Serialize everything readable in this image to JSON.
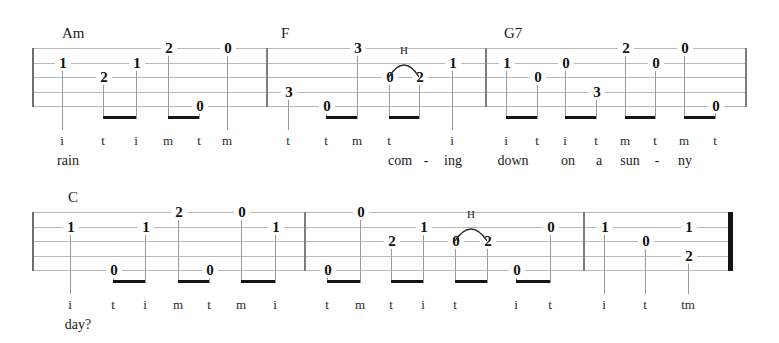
{
  "document": {
    "type": "banjo-tablature",
    "title": "",
    "num_systems": 2,
    "num_strings": 5,
    "notation": {
      "hammer_on_label": "H",
      "thumb": "t",
      "index": "i",
      "middle": "m"
    }
  },
  "colors": {
    "staff_line": "#b9b9bb",
    "barline": "#7d7d80",
    "final_barline": "#151515",
    "beam": "#141414",
    "text": "#1a1a1a",
    "background": "#ffffff"
  },
  "systems": [
    {
      "id": "system-1",
      "staff_top": 48,
      "staff_bottom": 106,
      "staff_left": 32,
      "staff_right": 747,
      "barlines": [
        266,
        485
      ],
      "measures": [
        {
          "id": "measure-1",
          "chord": "Am",
          "chord_x": 62,
          "chord_y": 26,
          "notes": [
            {
              "x": 62,
              "string": 2,
              "fret": "1"
            },
            {
              "x": 103,
              "string": 3,
              "fret": "2"
            },
            {
              "x": 136,
              "string": 2,
              "fret": "1"
            },
            {
              "x": 168,
              "string": 1,
              "fret": "2"
            },
            {
              "x": 199,
              "string": 5,
              "fret": "0"
            },
            {
              "x": 227,
              "string": 1,
              "fret": "0"
            }
          ],
          "beams": [
            {
              "x1": 103,
              "x2": 136
            },
            {
              "x1": 168,
              "x2": 199
            }
          ],
          "fingers": [
            {
              "x": 62,
              "label": "i"
            },
            {
              "x": 103,
              "label": "t"
            },
            {
              "x": 136,
              "label": "i"
            },
            {
              "x": 168,
              "label": "m"
            },
            {
              "x": 199,
              "label": "t"
            },
            {
              "x": 227,
              "label": "m"
            }
          ],
          "lyrics": [
            {
              "x": 68,
              "text": "rain"
            }
          ]
        },
        {
          "id": "measure-2",
          "chord": "F",
          "chord_x": 281,
          "chord_y": 26,
          "notes": [
            {
              "x": 288,
              "string": 4,
              "fret": "3"
            },
            {
              "x": 326,
              "string": 5,
              "fret": "0"
            },
            {
              "x": 357,
              "string": 1,
              "fret": "3"
            },
            {
              "x": 389,
              "string": 3,
              "fret": "0"
            },
            {
              "x": 419,
              "string": 3,
              "fret": "2"
            },
            {
              "x": 452,
              "string": 2,
              "fret": "1"
            }
          ],
          "beams": [
            {
              "x1": 326,
              "x2": 357
            },
            {
              "x1": 389,
              "x2": 419
            }
          ],
          "hammers": [
            {
              "x1": 389,
              "x2": 419,
              "label": "H"
            }
          ],
          "fingers": [
            {
              "x": 288,
              "label": "t"
            },
            {
              "x": 326,
              "label": "t"
            },
            {
              "x": 357,
              "label": "m"
            },
            {
              "x": 389,
              "label": "t"
            },
            {
              "x": 452,
              "label": "i"
            }
          ],
          "lyrics": [
            {
              "x": 400,
              "text": "com"
            },
            {
              "x": 426,
              "text": "-"
            },
            {
              "x": 453,
              "text": "ing"
            }
          ]
        },
        {
          "id": "measure-3",
          "chord": "G7",
          "chord_x": 504,
          "chord_y": 26,
          "notes": [
            {
              "x": 506,
              "string": 2,
              "fret": "1"
            },
            {
              "x": 537,
              "string": 3,
              "fret": "0"
            },
            {
              "x": 565,
              "string": 2,
              "fret": "0"
            },
            {
              "x": 596,
              "string": 4,
              "fret": "3"
            },
            {
              "x": 625,
              "string": 1,
              "fret": "2"
            },
            {
              "x": 655,
              "string": 2,
              "fret": "0"
            },
            {
              "x": 684,
              "string": 1,
              "fret": "0"
            },
            {
              "x": 715,
              "string": 5,
              "fret": "0"
            }
          ],
          "beams": [
            {
              "x1": 506,
              "x2": 537
            },
            {
              "x1": 565,
              "x2": 596
            },
            {
              "x1": 625,
              "x2": 655
            },
            {
              "x1": 684,
              "x2": 715
            }
          ],
          "fingers": [
            {
              "x": 506,
              "label": "i"
            },
            {
              "x": 537,
              "label": "t"
            },
            {
              "x": 565,
              "label": "i"
            },
            {
              "x": 596,
              "label": "t"
            },
            {
              "x": 625,
              "label": "m"
            },
            {
              "x": 655,
              "label": "t"
            },
            {
              "x": 684,
              "label": "m"
            },
            {
              "x": 715,
              "label": "t"
            }
          ],
          "lyrics": [
            {
              "x": 513,
              "text": "down"
            },
            {
              "x": 568,
              "text": "on"
            },
            {
              "x": 599,
              "text": "a"
            },
            {
              "x": 630,
              "text": "sun"
            },
            {
              "x": 657,
              "text": "-"
            },
            {
              "x": 685,
              "text": "ny"
            }
          ]
        }
      ]
    },
    {
      "id": "system-2",
      "staff_top": 212,
      "staff_bottom": 270,
      "staff_left": 32,
      "staff_right": 733,
      "barlines": [
        304,
        583
      ],
      "measures": [
        {
          "id": "measure-4",
          "chord": "C",
          "chord_x": 68,
          "chord_y": 190,
          "notes": [
            {
              "x": 70,
              "string": 2,
              "fret": "1"
            },
            {
              "x": 113,
              "string": 5,
              "fret": "0"
            },
            {
              "x": 145,
              "string": 2,
              "fret": "1"
            },
            {
              "x": 178,
              "string": 1,
              "fret": "2"
            },
            {
              "x": 209,
              "string": 5,
              "fret": "0"
            },
            {
              "x": 241,
              "string": 1,
              "fret": "0"
            },
            {
              "x": 275,
              "string": 2,
              "fret": "1"
            }
          ],
          "beams": [
            {
              "x1": 113,
              "x2": 145
            },
            {
              "x1": 178,
              "x2": 209
            },
            {
              "x1": 241,
              "x2": 275
            }
          ],
          "fingers": [
            {
              "x": 70,
              "label": "i"
            },
            {
              "x": 113,
              "label": "t"
            },
            {
              "x": 145,
              "label": "i"
            },
            {
              "x": 178,
              "label": "m"
            },
            {
              "x": 209,
              "label": "t"
            },
            {
              "x": 241,
              "label": "m"
            },
            {
              "x": 275,
              "label": "i"
            }
          ],
          "lyrics": [
            {
              "x": 78,
              "text": "day?"
            }
          ]
        },
        {
          "id": "measure-5",
          "chord": "",
          "chord_x": 0,
          "chord_y": 0,
          "notes": [
            {
              "x": 327,
              "string": 5,
              "fret": "0"
            },
            {
              "x": 360,
              "string": 1,
              "fret": "0"
            },
            {
              "x": 391,
              "string": 3,
              "fret": "2"
            },
            {
              "x": 423,
              "string": 2,
              "fret": "1"
            },
            {
              "x": 455,
              "string": 3,
              "fret": "0"
            },
            {
              "x": 487,
              "string": 3,
              "fret": "2"
            },
            {
              "x": 516,
              "string": 5,
              "fret": "0"
            },
            {
              "x": 550,
              "string": 2,
              "fret": "0"
            }
          ],
          "beams": [
            {
              "x1": 327,
              "x2": 360
            },
            {
              "x1": 391,
              "x2": 423
            },
            {
              "x1": 455,
              "x2": 487
            },
            {
              "x1": 516,
              "x2": 550
            }
          ],
          "hammers": [
            {
              "x1": 455,
              "x2": 487,
              "label": "H"
            }
          ],
          "fingers": [
            {
              "x": 327,
              "label": "t"
            },
            {
              "x": 360,
              "label": "m"
            },
            {
              "x": 391,
              "label": "t"
            },
            {
              "x": 423,
              "label": "i"
            },
            {
              "x": 455,
              "label": "t"
            },
            {
              "x": 516,
              "label": "i"
            },
            {
              "x": 550,
              "label": "t"
            }
          ],
          "lyrics": []
        },
        {
          "id": "measure-6",
          "chord": "",
          "chord_x": 0,
          "chord_y": 0,
          "notes": [
            {
              "x": 604,
              "string": 2,
              "fret": "1"
            },
            {
              "x": 645,
              "string": 3,
              "fret": "0"
            },
            {
              "x": 688,
              "string": 2,
              "fret": "1"
            },
            {
              "x": 688,
              "string": 4,
              "fret": "2"
            }
          ],
          "beams": [],
          "fingers": [
            {
              "x": 604,
              "label": "i"
            },
            {
              "x": 645,
              "label": "t"
            },
            {
              "x": 688,
              "label": "tm"
            }
          ],
          "lyrics": []
        }
      ]
    }
  ]
}
